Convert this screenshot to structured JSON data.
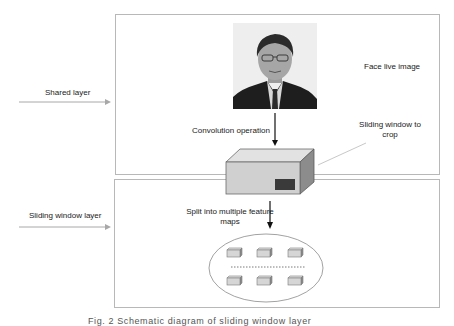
{
  "diagram": {
    "left_labels": {
      "shared_layer": "Shared layer",
      "sliding_window_layer": "Sliding window layer"
    },
    "top_panel": {
      "image_label": "Face live image",
      "image_subject": "face-photo",
      "arrow_label": "Convolution operation",
      "annotation": "Sliding window to\ncrop",
      "annotation_line1": "Sliding window to",
      "annotation_line2": "crop"
    },
    "bottom_panel": {
      "arrow_label_line1": "Split into multiple feature",
      "arrow_label_line2": "maps",
      "feature_maps_rows": 2,
      "feature_maps_per_row": 3,
      "separator": "dotted-line"
    },
    "caption": "Fig. 2  Schematic diagram of sliding window layer"
  },
  "colors": {
    "border": "#b8b8b8",
    "arrow_gray": "#a0a0a0",
    "arrow_black": "#111111",
    "cube_front": "#d2d2d2",
    "cube_top": "#e4e4e4",
    "cube_side": "#8e8e8e",
    "crop_window": "#3a3a3a"
  }
}
